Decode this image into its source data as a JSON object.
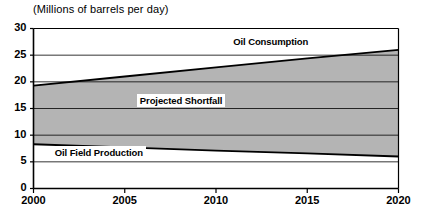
{
  "chart_data": {
    "type": "area",
    "title": "(Millions of barrels per day)",
    "xlabel": "",
    "ylabel": "",
    "xlim": [
      2000,
      2020
    ],
    "ylim": [
      0,
      30
    ],
    "grid": true,
    "legend_position": "inline-annotations",
    "x_ticks": [
      "2000",
      "2005",
      "2010",
      "2015",
      "2020"
    ],
    "x_tick_values": [
      2000,
      2005,
      2010,
      2015,
      2020
    ],
    "y_ticks": [
      "0",
      "5",
      "10",
      "15",
      "20",
      "25",
      "30"
    ],
    "y_tick_values": [
      0,
      5,
      10,
      15,
      20,
      25,
      30
    ],
    "x": [
      2000,
      2005,
      2010,
      2015,
      2020
    ],
    "series": [
      {
        "name": "Oil Consumption",
        "values": [
          19.3,
          21.0,
          22.7,
          24.4,
          26.0
        ],
        "color": "#000000",
        "label_x": 2013.0,
        "label_y": 27.2
      },
      {
        "name": "Oil Field Production",
        "values": [
          8.3,
          7.7,
          7.1,
          6.6,
          6.0
        ],
        "color": "#000000",
        "label_x": 2001.0,
        "label_y": 6.5
      }
    ],
    "bands": [
      {
        "name": "Projected Shortfall",
        "upper_series": "Oil Consumption",
        "lower_series": "Oil Field Production",
        "fill": "#b4b4b4",
        "label_x": 2008.1,
        "label_y": 16.3
      }
    ],
    "colors": {
      "band_fill": "#b4b4b4",
      "axis": "#000000",
      "gridline": "#000000",
      "background": "#ffffff"
    }
  },
  "annotations": {
    "consumption_label": "Oil Consumption",
    "shortfall_label": "Projected Shortfall",
    "production_label": "Oil Field Production"
  }
}
